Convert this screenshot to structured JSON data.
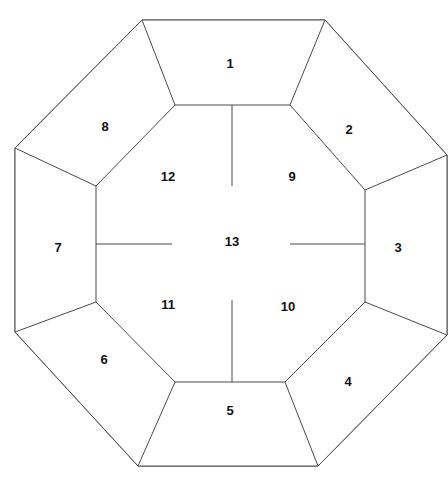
{
  "figure": {
    "background_color": "#ffffff",
    "stroke_color": "#4a4a4a",
    "label_color": "#111111",
    "canvas": {
      "width": 448,
      "height": 484
    }
  },
  "regions": [
    {
      "id": "region-1",
      "label": "1",
      "label_x": 230,
      "label_y": 65,
      "shape": "trapezoid",
      "group": "outer-ring",
      "points": "142,20 325,20 290,105 175,105"
    },
    {
      "id": "region-2",
      "label": "2",
      "label_x": 349,
      "label_y": 131,
      "shape": "trapezoid",
      "group": "outer-ring",
      "points": "325,20 447,155 365,190 290,105"
    },
    {
      "id": "region-3",
      "label": "3",
      "label_x": 398,
      "label_y": 249,
      "shape": "trapezoid",
      "group": "outer-ring",
      "points": "447,155 447,335 365,302 365,190"
    },
    {
      "id": "region-4",
      "label": "4",
      "label_x": 348,
      "label_y": 383,
      "shape": "trapezoid",
      "group": "outer-ring",
      "points": "447,335 318,466 285,382 365,302"
    },
    {
      "id": "region-5",
      "label": "5",
      "label_x": 230,
      "label_y": 412,
      "shape": "trapezoid",
      "group": "outer-ring",
      "points": "318,466 138,466 175,382 285,382"
    },
    {
      "id": "region-6",
      "label": "6",
      "label_x": 104,
      "label_y": 361,
      "shape": "trapezoid",
      "group": "outer-ring",
      "points": "138,466 15,332 96,302 175,382"
    },
    {
      "id": "region-7",
      "label": "7",
      "label_x": 58,
      "label_y": 249,
      "shape": "trapezoid",
      "group": "outer-ring",
      "points": "15,332 15,148 96,186 96,302"
    },
    {
      "id": "region-8",
      "label": "8",
      "label_x": 105,
      "label_y": 128,
      "shape": "trapezoid",
      "group": "outer-ring",
      "points": "15,148 142,20 175,105 96,186"
    },
    {
      "id": "region-9",
      "label": "9",
      "label_x": 292,
      "label_y": 178,
      "shape": "pentagon",
      "group": "inner-ring",
      "points": "232,105 290,105 365,190 365,244 290,244 232,186"
    },
    {
      "id": "region-10",
      "label": "10",
      "label_x": 288,
      "label_y": 308,
      "shape": "pentagon",
      "group": "inner-ring",
      "points": "365,244 365,302 285,382 232,382 232,300 290,244"
    },
    {
      "id": "region-11",
      "label": "11",
      "label_x": 168,
      "label_y": 306,
      "shape": "pentagon",
      "group": "inner-ring",
      "points": "232,382 175,382 96,302 96,244 172,244 232,300"
    },
    {
      "id": "region-12",
      "label": "12",
      "label_x": 168,
      "label_y": 178,
      "shape": "pentagon",
      "group": "inner-ring",
      "points": "96,244 96,186 175,105 232,105 232,186 172,244"
    },
    {
      "id": "region-13",
      "label": "13",
      "label_x": 232,
      "label_y": 243,
      "shape": "diamond",
      "group": "center",
      "points": "232,186 290,244 232,300 172,244"
    }
  ],
  "outer_octagon": {
    "points": "142,20 325,20 447,155 447,335 318,466 138,466 15,332 15,148",
    "sides": 8
  },
  "inner_octagon": {
    "points": "175,105 290,105 365,190 365,302 285,382 175,382 96,302 96,186",
    "sides": 8
  },
  "spokes": [
    {
      "name": "spoke-top",
      "x1": 232,
      "y1": 105,
      "x2": 232,
      "y2": 186
    },
    {
      "name": "spoke-right",
      "x1": 365,
      "y1": 244,
      "x2": 290,
      "y2": 244
    },
    {
      "name": "spoke-bottom",
      "x1": 232,
      "y1": 382,
      "x2": 232,
      "y2": 300
    },
    {
      "name": "spoke-left",
      "x1": 96,
      "y1": 244,
      "x2": 172,
      "y2": 244
    }
  ],
  "radials": [
    {
      "name": "radial-top-left",
      "x1": 142,
      "y1": 20,
      "x2": 175,
      "y2": 105
    },
    {
      "name": "radial-top-right",
      "x1": 325,
      "y1": 20,
      "x2": 290,
      "y2": 105
    },
    {
      "name": "radial-right-top",
      "x1": 447,
      "y1": 155,
      "x2": 365,
      "y2": 190
    },
    {
      "name": "radial-right-bottom",
      "x1": 447,
      "y1": 335,
      "x2": 365,
      "y2": 302
    },
    {
      "name": "radial-bottom-right",
      "x1": 318,
      "y1": 466,
      "x2": 285,
      "y2": 382
    },
    {
      "name": "radial-bottom-left",
      "x1": 138,
      "y1": 466,
      "x2": 175,
      "y2": 382
    },
    {
      "name": "radial-left-bottom",
      "x1": 15,
      "y1": 332,
      "x2": 96,
      "y2": 302
    },
    {
      "name": "radial-left-top",
      "x1": 15,
      "y1": 148,
      "x2": 96,
      "y2": 186
    }
  ]
}
